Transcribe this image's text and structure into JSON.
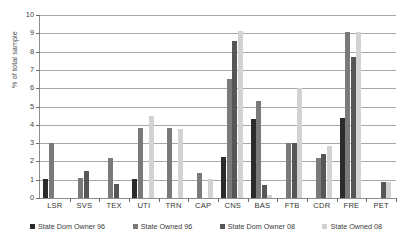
{
  "chart_data": {
    "type": "bar",
    "title": "",
    "xlabel": "",
    "ylabel": "% of total sample",
    "ylim": [
      0,
      10
    ],
    "yticks": [
      0,
      1,
      2,
      3,
      4,
      5,
      6,
      7,
      8,
      9,
      10
    ],
    "grid": true,
    "legend_position": "bottom",
    "categories": [
      "LSR",
      "SVS",
      "TEX",
      "UTI",
      "TRN",
      "CAP",
      "CNS",
      "BAS",
      "FTB",
      "CDR",
      "FRE",
      "PET"
    ],
    "series": [
      {
        "name": "State Dom Owner 96",
        "color": "#2b2b2b",
        "values": [
          1.05,
          0.0,
          0.0,
          1.05,
          0.0,
          0.0,
          2.25,
          4.3,
          0.0,
          0.0,
          4.35,
          0.0
        ]
      },
      {
        "name": "State Owned 96",
        "color": "#7a7a7a",
        "values": [
          3.0,
          1.1,
          2.2,
          3.8,
          3.8,
          1.35,
          6.5,
          5.3,
          3.0,
          2.2,
          9.05,
          0.0
        ]
      },
      {
        "name": "State Dom Owner 08",
        "color": "#565656",
        "values": [
          0.0,
          1.5,
          0.75,
          0.0,
          0.0,
          0.0,
          8.6,
          0.7,
          3.0,
          2.4,
          7.7,
          0.9
        ]
      },
      {
        "name": "State Owned 08",
        "color": "#d2d2d2",
        "values": [
          0.0,
          0.0,
          0.0,
          4.5,
          3.75,
          1.05,
          9.1,
          0.15,
          6.0,
          2.85,
          9.05,
          0.85
        ]
      }
    ]
  },
  "axis": {
    "y_title": "% of total sample"
  },
  "legend": {
    "items": [
      {
        "label": "State Dom Owner 96",
        "color": "#2b2b2b"
      },
      {
        "label": "State Owned 96",
        "color": "#7a7a7a"
      },
      {
        "label": "State Dom Owner 08",
        "color": "#565656"
      },
      {
        "label": "State Owned 08",
        "color": "#d2d2d2"
      }
    ]
  }
}
